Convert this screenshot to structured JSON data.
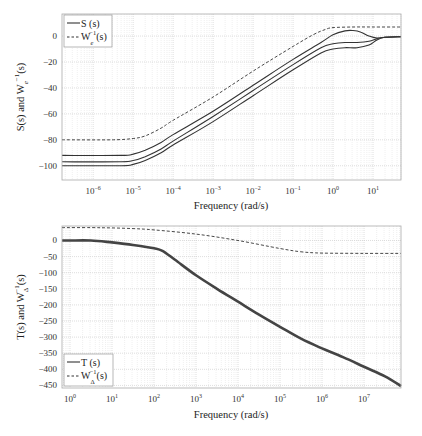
{
  "chart_data": [
    {
      "type": "line",
      "title": "",
      "xlabel": "Frequency (rad/s)",
      "ylabel": "S(s) and W_e^-1(s)",
      "xscale": "log",
      "xlim_log10": [
        -6.78,
        1.7
      ],
      "ylim": [
        -111,
        17
      ],
      "grid": true,
      "legend_position": "upper left",
      "xticks": [
        "10^-6",
        "10^-5",
        "10^-4",
        "10^-3",
        "10^-2",
        "10^-1",
        "10^0",
        "10^1"
      ],
      "xtick_exponents": [
        -6,
        -5,
        -4,
        -3,
        -2,
        -1,
        0,
        1
      ],
      "yticks": [
        0,
        -20,
        -40,
        -60,
        -80,
        -100
      ],
      "legend": [
        {
          "label": "S (s)",
          "style": "solid"
        },
        {
          "label": "W_e^-1(s)",
          "style": "dashed"
        }
      ],
      "series": [
        {
          "name": "W_e^-1(s)",
          "style": "dashed",
          "x_log10": [
            -6.78,
            -5.5,
            -5.0,
            -4.7,
            -4.3,
            -4.0,
            -3.0,
            -2.0,
            -1.0,
            -0.5,
            -0.2,
            0.0,
            0.5,
            1.0,
            1.7
          ],
          "y": [
            -80,
            -80,
            -79,
            -77,
            -71,
            -65,
            -47,
            -27,
            -8,
            1,
            5,
            6.5,
            7,
            7,
            7
          ]
        },
        {
          "name": "S (s) upper",
          "style": "solid",
          "x_log10": [
            -6.78,
            -5.3,
            -5.0,
            -4.7,
            -4.3,
            -4.0,
            -3.0,
            -2.0,
            -1.0,
            -0.3,
            0.0,
            0.3,
            0.5,
            0.7,
            0.9,
            1.1,
            1.3,
            1.7
          ],
          "y": [
            -92,
            -92,
            -91,
            -88,
            -82,
            -76,
            -58,
            -38,
            -18,
            -5,
            1,
            4,
            4.3,
            3,
            0,
            -1.5,
            -1,
            -0.5
          ]
        },
        {
          "name": "S (s) middle",
          "style": "solid",
          "x_log10": [
            -6.78,
            -5.3,
            -5.0,
            -4.7,
            -4.3,
            -4.0,
            -3.0,
            -2.0,
            -1.0,
            -0.3,
            0.0,
            0.3,
            0.6,
            0.9,
            1.1,
            1.3,
            1.7
          ],
          "y": [
            -97,
            -97,
            -96,
            -93,
            -87,
            -81,
            -62,
            -42,
            -22,
            -9,
            -6,
            -5,
            -5,
            -4,
            -2,
            -1,
            -0.5
          ]
        },
        {
          "name": "S (s) lower",
          "style": "solid",
          "x_log10": [
            -6.78,
            -5.3,
            -5.0,
            -4.7,
            -4.3,
            -4.0,
            -3.0,
            -2.0,
            -1.0,
            -0.3,
            0.0,
            0.3,
            0.6,
            0.9,
            1.1,
            1.3,
            1.7
          ],
          "y": [
            -100,
            -100,
            -99,
            -96,
            -90,
            -84,
            -66,
            -46,
            -26,
            -13,
            -10,
            -9,
            -9,
            -7,
            -3,
            -1,
            -0.5
          ]
        }
      ]
    },
    {
      "type": "line",
      "title": "",
      "xlabel": "Frequency (rad/s)",
      "ylabel": "T(s) and W_Δ^-1(s)",
      "xscale": "log",
      "xlim_log10": [
        -0.19,
        7.88
      ],
      "ylim": [
        -458,
        45
      ],
      "grid": true,
      "legend_position": "lower left",
      "xticks": [
        "10^0",
        "10^1",
        "10^2",
        "10^3",
        "10^4",
        "10^5",
        "10^6",
        "10^7"
      ],
      "xtick_exponents": [
        0,
        1,
        2,
        3,
        4,
        5,
        6,
        7
      ],
      "yticks": [
        0,
        -50,
        -100,
        -150,
        -200,
        -250,
        -300,
        -350,
        -400,
        -450
      ],
      "legend": [
        {
          "label": "T (s)",
          "style": "solid"
        },
        {
          "label": "W_Δ^-1(s)",
          "style": "dashed"
        }
      ],
      "series": [
        {
          "name": "W_Δ^-1(s)",
          "style": "dashed",
          "x_log10": [
            -0.19,
            0.5,
            1.0,
            1.5,
            2.0,
            3.0,
            4.0,
            5.0,
            5.5,
            6.0,
            7.0,
            7.88
          ],
          "y": [
            40,
            40,
            39,
            37,
            33,
            20,
            0,
            -25,
            -35,
            -39,
            -40,
            -40
          ]
        },
        {
          "name": "T (s)",
          "style": "solid",
          "x_log10": [
            -0.19,
            0.0,
            0.5,
            1.0,
            1.5,
            2.0,
            2.2,
            2.5,
            3.0,
            3.5,
            4.0,
            4.5,
            5.0,
            5.5,
            6.0,
            6.5,
            7.0,
            7.5,
            7.88
          ],
          "y": [
            0,
            0,
            0,
            -6,
            -14,
            -24,
            -32,
            -60,
            -108,
            -150,
            -190,
            -230,
            -268,
            -305,
            -335,
            -362,
            -392,
            -422,
            -452
          ]
        }
      ]
    }
  ],
  "labels": {
    "freq": "Frequency (rad/s)",
    "s_main": "S(s) and W",
    "s_sub": "e",
    "s_sup": "−1",
    "s_tail": "(s)",
    "t_main": "T(s) and W",
    "t_sub": "Δ",
    "t_sup": "−1",
    "t_tail": "(s)",
    "leg_S": "S (s)",
    "leg_T": "T (s)",
    "leg_W": "W",
    "leg_Wtail": "(s)"
  },
  "colors": {
    "line": "#333333",
    "grid": "#c8c8c8",
    "minor_grid": "#dedede",
    "axis": "#999999",
    "background": "#ffffff"
  }
}
